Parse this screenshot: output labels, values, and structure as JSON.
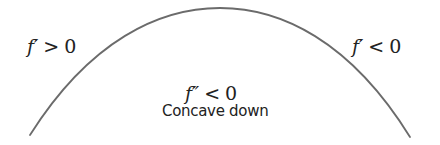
{
  "diagram": {
    "type": "concavity-diagram",
    "curve": {
      "shape": "concave-down arc",
      "stroke_color": "#6b6b6b",
      "start": [
        30,
        135
      ],
      "peak": [
        220,
        8
      ],
      "end": [
        410,
        137
      ]
    },
    "left_label": {
      "func": "f′",
      "relation": ">",
      "value": "0"
    },
    "right_label": {
      "func": "f′",
      "relation": "<",
      "value": "0"
    },
    "center_label": {
      "func": "f″",
      "relation": "<",
      "value": "0"
    },
    "caption": "Concave down"
  }
}
